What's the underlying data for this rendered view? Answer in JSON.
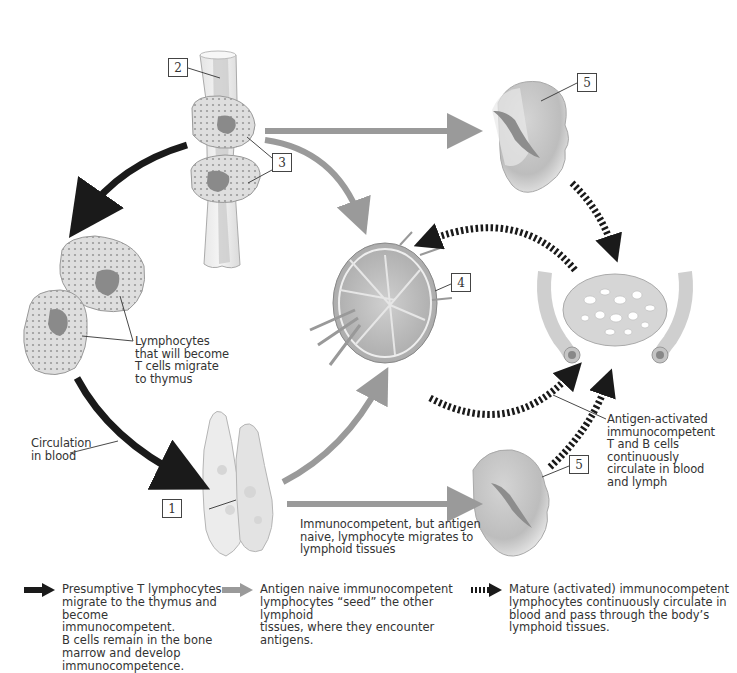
{
  "figure": {
    "number_labels": [
      {
        "id": "1",
        "text": "1",
        "target": "thymus"
      },
      {
        "id": "2",
        "text": "2",
        "target": "bone-marrow"
      },
      {
        "id": "3",
        "text": "3",
        "target": "lymphocytes-in-marrow"
      },
      {
        "id": "4",
        "text": "4",
        "target": "lymph-node"
      },
      {
        "id": "5a",
        "text": "5",
        "target": "spleen-upper"
      },
      {
        "id": "5b",
        "text": "5",
        "target": "spleen-lower"
      }
    ],
    "annotations": {
      "lymphocytes_migrate": "Lymphocytes\nthat will become\nT cells migrate\nto thymus",
      "circulation": "Circulation\nin blood",
      "antigen_activated": "Antigen-activated\nimmunocompetent\nT and B cells\ncontinuously\ncirculate in blood\nand lymph",
      "immunocompetent_naive": "Immunocompetent, but antigen\nnaive, lymphocyte migrates to\nlymphoid tissues"
    },
    "arrow_styles": {
      "black": "#1a1a1a",
      "gray": "#9a9a9a",
      "dashed": "#1a1a1a"
    }
  },
  "legend": [
    {
      "style": "black-solid",
      "text": "Presumptive T lymphocytes\nmigrate to the thymus and\nbecome immunocompetent.\nB cells remain in the bone\nmarrow and develop\nimmunocompetence."
    },
    {
      "style": "gray-solid",
      "text": "Antigen naive immunocompetent\nlymphocytes “seed” the other lymphoid\ntissues, where they encounter antigens."
    },
    {
      "style": "black-dashed",
      "text": "Mature (activated) immunocompetent\nlymphocytes continuously circulate in\nblood and pass through the body’s\nlymphoid tissues."
    }
  ]
}
